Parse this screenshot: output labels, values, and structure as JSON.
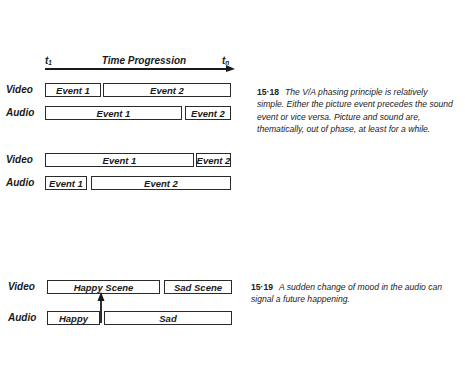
{
  "timeline": {
    "start_label": "t",
    "start_sub": "1",
    "title": "Time Progression",
    "end_label": "t",
    "end_sub": "n"
  },
  "figure_15_18": {
    "diagram_a": {
      "video": {
        "label": "Video",
        "events": [
          "Event 1",
          "Event 2"
        ]
      },
      "audio": {
        "label": "Audio",
        "events": [
          "Event 1",
          "Event 2"
        ]
      }
    },
    "diagram_b": {
      "video": {
        "label": "Video",
        "events": [
          "Event 1",
          "Event 2"
        ]
      },
      "audio": {
        "label": "Audio",
        "events": [
          "Event 1",
          "Event 2"
        ]
      }
    },
    "caption": {
      "number": "15·18",
      "text": "The V/A phasing principle is relatively simple. Either the picture event precedes the sound event or vice versa. Picture and sound are, thematically, out of phase, at least for a while."
    }
  },
  "figure_15_19": {
    "video": {
      "label": "Video",
      "events": [
        "Happy Scene",
        "Sad Scene"
      ]
    },
    "audio": {
      "label": "Audio",
      "events": [
        "Happy",
        "Sad"
      ]
    },
    "caption": {
      "number": "15·19",
      "text": "A sudden change of mood in the audio can signal a future happening."
    }
  }
}
